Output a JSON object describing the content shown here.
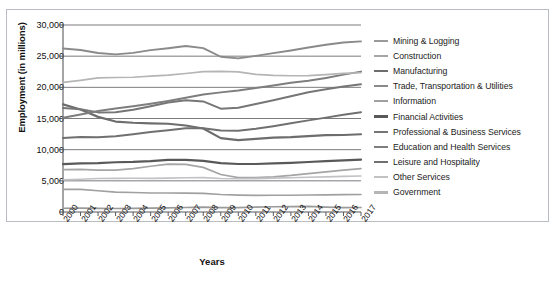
{
  "chart_data": {
    "type": "line",
    "title": "",
    "xlabel": "Years",
    "ylabel": "Employment (in millions)",
    "ylim": [
      0,
      30000
    ],
    "yticks": [
      "0",
      "5,000",
      "10,000",
      "15,000",
      "20,000",
      "25,000",
      "30,000"
    ],
    "ytick_values": [
      0,
      5000,
      10000,
      15000,
      20000,
      25000,
      30000
    ],
    "grid": true,
    "legend_position": "right",
    "x": [
      "2000",
      "2001",
      "2002",
      "2003",
      "2004",
      "2005",
      "2006",
      "2007",
      "2008",
      "2009",
      "2010",
      "2011",
      "2012",
      "2013",
      "2014",
      "2015",
      "2016",
      "2017"
    ],
    "categories": [
      "2000",
      "2001",
      "2002",
      "2003",
      "2004",
      "2005",
      "2006",
      "2007",
      "2008",
      "2009",
      "2010",
      "2011",
      "2012",
      "2013",
      "2014",
      "2015",
      "2016",
      "2017"
    ],
    "series": [
      {
        "name": "Mining & Logging",
        "color": "#9a9a9a",
        "width": 1.7,
        "values": [
          600,
          610,
          580,
          560,
          580,
          620,
          670,
          720,
          790,
          690,
          710,
          790,
          840,
          860,
          890,
          790,
          700,
          720
        ]
      },
      {
        "name": "Construction",
        "color": "#a5a5a5",
        "width": 1.7,
        "values": [
          6800,
          6830,
          6720,
          6730,
          6960,
          7340,
          7690,
          7630,
          7160,
          6020,
          5520,
          5530,
          5640,
          5860,
          6150,
          6450,
          6710,
          6970
        ]
      },
      {
        "name": "Manufacturing",
        "color": "#6d6d6d",
        "width": 2.2,
        "values": [
          17260,
          16440,
          15260,
          14510,
          14320,
          14230,
          14160,
          13880,
          13400,
          11850,
          11530,
          11730,
          11930,
          12020,
          12180,
          12330,
          12350,
          12470
        ]
      },
      {
        "name": "Trade, Transportation & Utilities",
        "color": "#8a8a8a",
        "width": 1.9,
        "values": [
          26230,
          25980,
          25500,
          25290,
          25530,
          25960,
          26280,
          26630,
          26290,
          24910,
          24640,
          25050,
          25480,
          25910,
          26390,
          26840,
          27190,
          27380
        ]
      },
      {
        "name": "Information",
        "color": "#a0a0a0",
        "width": 1.6,
        "values": [
          3630,
          3630,
          3400,
          3190,
          3120,
          3060,
          3040,
          3030,
          2980,
          2800,
          2710,
          2670,
          2680,
          2690,
          2720,
          2750,
          2790,
          2810
        ]
      },
      {
        "name": "Financial Activities",
        "color": "#595959",
        "width": 2.2,
        "values": [
          7690,
          7810,
          7850,
          7980,
          8030,
          8150,
          8360,
          8350,
          8200,
          7840,
          7700,
          7700,
          7790,
          7890,
          8020,
          8160,
          8290,
          8400
        ]
      },
      {
        "name": "Professional & Business Services",
        "color": "#767676",
        "width": 2.0,
        "values": [
          16670,
          16480,
          15980,
          15990,
          16390,
          16950,
          17570,
          17940,
          17740,
          16580,
          16730,
          17330,
          17930,
          18560,
          19210,
          19690,
          20130,
          20500
        ]
      },
      {
        "name": "Education and Health Services",
        "color": "#7e7e7e",
        "width": 2.0,
        "values": [
          15110,
          15640,
          16200,
          16590,
          16950,
          17370,
          17820,
          18320,
          18840,
          19190,
          19480,
          19890,
          20310,
          20730,
          21040,
          21510,
          22040,
          22520
        ]
      },
      {
        "name": "Leisure and Hospitality",
        "color": "#707070",
        "width": 2.0,
        "values": [
          11860,
          12030,
          11990,
          12170,
          12490,
          12820,
          13110,
          13430,
          13440,
          13080,
          13050,
          13350,
          13770,
          14250,
          14700,
          15140,
          15620,
          16020
        ]
      },
      {
        "name": "Other Services",
        "color": "#c2c2c2",
        "width": 1.6,
        "values": [
          5170,
          5260,
          5370,
          5400,
          5410,
          5400,
          5440,
          5490,
          5520,
          5370,
          5330,
          5360,
          5430,
          5490,
          5570,
          5630,
          5710,
          5780
        ]
      },
      {
        "name": "Government",
        "color": "#b5b5b5",
        "width": 1.7,
        "values": [
          20790,
          21120,
          21510,
          21580,
          21620,
          21800,
          21970,
          22220,
          22510,
          22550,
          22490,
          22090,
          21920,
          21860,
          21890,
          22050,
          22250,
          22340
        ]
      }
    ]
  }
}
